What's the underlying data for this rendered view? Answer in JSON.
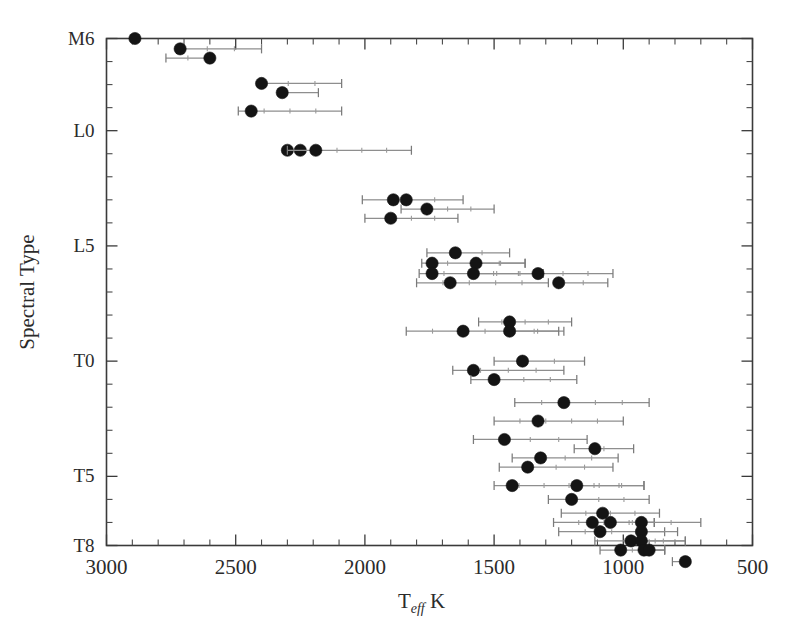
{
  "chart_data": {
    "type": "scatter",
    "title": "",
    "xlabel": "T_eff  K",
    "xlabel_main": "T",
    "xlabel_sub": "eff",
    "xlabel_unit": "K",
    "ylabel": "Spectral Type",
    "xlim": [
      3000,
      500
    ],
    "ylim": [
      "M6",
      "T8"
    ],
    "x_reversed": true,
    "grid": false,
    "legend": null,
    "x_ticks_major": [
      3000,
      2500,
      2000,
      1500,
      1000,
      500
    ],
    "x_tick_labels": [
      "3000",
      "2500",
      "2000",
      "1500",
      "1000",
      "500"
    ],
    "x_ticks_minor_step": 100,
    "y_ticks_major": [
      "M6",
      "L0",
      "L5",
      "T0",
      "T5",
      "T8"
    ],
    "y_tick_labels": [
      "M6",
      "L0",
      "L5",
      "T0",
      "T5",
      "T8"
    ],
    "y_axis_index": {
      "M6": 0,
      "M7": 1,
      "M8": 2,
      "M9": 3,
      "L0": 4,
      "L1": 5,
      "L2": 6,
      "L3": 7,
      "L4": 8,
      "L5": 9,
      "L6": 10,
      "L7": 11,
      "L8": 12,
      "L9": 13,
      "T0": 14,
      "T1": 15,
      "T2": 16,
      "T3": 17,
      "T4": 18,
      "T5": 19,
      "T6": 20,
      "T7": 21,
      "T8": 22
    },
    "point_marker": "filled-circle",
    "errorbar_direction": "horizontal",
    "xunit": "K",
    "series": [
      {
        "name": "Effective temperature by spectral type",
        "points": [
          {
            "sptype": "M6",
            "row": 0.0,
            "teff": 2890,
            "err_low": 2890,
            "err_high": 2890
          },
          {
            "sptype": "M6",
            "row": 0.45,
            "teff": 2715,
            "err_low": 2715,
            "err_high": 2400
          },
          {
            "sptype": "M7",
            "row": 0.85,
            "teff": 2600,
            "err_low": 2770,
            "err_high": 2600
          },
          {
            "sptype": "M8",
            "row": 1.95,
            "teff": 2400,
            "err_low": 2400,
            "err_high": 2090
          },
          {
            "sptype": "M9",
            "row": 2.35,
            "teff": 2320,
            "err_low": 2320,
            "err_high": 2180
          },
          {
            "sptype": "M9",
            "row": 3.15,
            "teff": 2440,
            "err_low": 2490,
            "err_high": 2090
          },
          {
            "sptype": "L1",
            "row": 4.85,
            "teff": 2300,
            "err_low": 2300,
            "err_high": 2300
          },
          {
            "sptype": "L1",
            "row": 4.85,
            "teff": 2250,
            "err_low": 2250,
            "err_high": 2250
          },
          {
            "sptype": "L1",
            "row": 4.85,
            "teff": 2190,
            "err_low": 2300,
            "err_high": 1820
          },
          {
            "sptype": "L3",
            "row": 7.0,
            "teff": 1890,
            "err_low": 2010,
            "err_high": 1890
          },
          {
            "sptype": "L3",
            "row": 7.0,
            "teff": 1840,
            "err_low": 1840,
            "err_high": 1620
          },
          {
            "sptype": "L4",
            "row": 7.4,
            "teff": 1760,
            "err_low": 1860,
            "err_high": 1500
          },
          {
            "sptype": "L4",
            "row": 7.8,
            "teff": 1900,
            "err_low": 2000,
            "err_high": 1640
          },
          {
            "sptype": "L5",
            "row": 9.3,
            "teff": 1650,
            "err_low": 1760,
            "err_high": 1440
          },
          {
            "sptype": "L6",
            "row": 9.75,
            "teff": 1740,
            "err_low": 1780,
            "err_high": 1380
          },
          {
            "sptype": "L6",
            "row": 9.75,
            "teff": 1570,
            "err_low": 1570,
            "err_high": 1380
          },
          {
            "sptype": "L7",
            "row": 10.2,
            "teff": 1740,
            "err_low": 1790,
            "err_high": 1310
          },
          {
            "sptype": "L7",
            "row": 10.2,
            "teff": 1580,
            "err_low": 1580,
            "err_high": 1310
          },
          {
            "sptype": "L7",
            "row": 10.2,
            "teff": 1330,
            "err_low": 1330,
            "err_high": 1040
          },
          {
            "sptype": "L8",
            "row": 10.6,
            "teff": 1670,
            "err_low": 1800,
            "err_high": 1290
          },
          {
            "sptype": "L8",
            "row": 10.6,
            "teff": 1250,
            "err_low": 1250,
            "err_high": 1060
          },
          {
            "sptype": "L9",
            "row": 12.3,
            "teff": 1440,
            "err_low": 1560,
            "err_high": 1200
          },
          {
            "sptype": "L9",
            "row": 12.7,
            "teff": 1620,
            "err_low": 1840,
            "err_high": 1230
          },
          {
            "sptype": "L9",
            "row": 12.7,
            "teff": 1440,
            "err_low": 1440,
            "err_high": 1250
          },
          {
            "sptype": "T0",
            "row": 14.0,
            "teff": 1390,
            "err_low": 1500,
            "err_high": 1150
          },
          {
            "sptype": "T0",
            "row": 14.4,
            "teff": 1580,
            "err_low": 1660,
            "err_high": 1230
          },
          {
            "sptype": "T0",
            "row": 14.8,
            "teff": 1500,
            "err_low": 1590,
            "err_high": 1180
          },
          {
            "sptype": "T1",
            "row": 15.8,
            "teff": 1230,
            "err_low": 1420,
            "err_high": 900
          },
          {
            "sptype": "T2",
            "row": 16.6,
            "teff": 1330,
            "err_low": 1500,
            "err_high": 1000
          },
          {
            "sptype": "T3",
            "row": 17.4,
            "teff": 1460,
            "err_low": 1580,
            "err_high": 1140
          },
          {
            "sptype": "T3",
            "row": 17.8,
            "teff": 1110,
            "err_low": 1190,
            "err_high": 960
          },
          {
            "sptype": "T4",
            "row": 18.2,
            "teff": 1320,
            "err_low": 1430,
            "err_high": 1020
          },
          {
            "sptype": "T4",
            "row": 18.6,
            "teff": 1370,
            "err_low": 1480,
            "err_high": 1040
          },
          {
            "sptype": "T5",
            "row": 19.4,
            "teff": 1430,
            "err_low": 1500,
            "err_high": 920
          },
          {
            "sptype": "T5",
            "row": 19.4,
            "teff": 1180,
            "err_low": 1180,
            "err_high": 920
          },
          {
            "sptype": "T5",
            "row": 20.0,
            "teff": 1200,
            "err_low": 1290,
            "err_high": 900
          },
          {
            "sptype": "T6",
            "row": 20.6,
            "teff": 1080,
            "err_low": 1240,
            "err_high": 860
          },
          {
            "sptype": "T6",
            "row": 21.0,
            "teff": 1120,
            "err_low": 1270,
            "err_high": 880
          },
          {
            "sptype": "T6",
            "row": 21.0,
            "teff": 1050,
            "err_low": 1050,
            "err_high": 880
          },
          {
            "sptype": "T6",
            "row": 21.0,
            "teff": 930,
            "err_low": 930,
            "err_high": 700
          },
          {
            "sptype": "T7",
            "row": 21.4,
            "teff": 1090,
            "err_low": 1250,
            "err_high": 840
          },
          {
            "sptype": "T7",
            "row": 21.4,
            "teff": 930,
            "err_low": 930,
            "err_high": 790
          },
          {
            "sptype": "T7",
            "row": 21.8,
            "teff": 970,
            "err_low": 1110,
            "err_high": 760
          },
          {
            "sptype": "T7",
            "row": 21.8,
            "teff": 930,
            "err_low": 930,
            "err_high": 760
          },
          {
            "sptype": "T8",
            "row": 22.2,
            "teff": 1010,
            "err_low": 1090,
            "err_high": 840
          },
          {
            "sptype": "T8",
            "row": 22.2,
            "teff": 920,
            "err_low": 920,
            "err_high": 840
          },
          {
            "sptype": "T8",
            "row": 22.2,
            "teff": 900,
            "err_low": 900,
            "err_high": 840
          },
          {
            "sptype": "T8",
            "row": 22.7,
            "teff": 760,
            "err_low": 810,
            "err_high": 760
          }
        ]
      }
    ]
  },
  "figure": {
    "background_color": "#ffffff",
    "marker_color": "#141414",
    "errorbar_color": "#8e8e8e",
    "axis_color": "#3a3a3a"
  }
}
